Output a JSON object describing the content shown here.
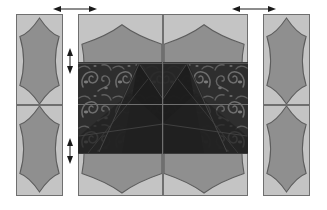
{
  "diagram": {
    "background_color": "#ffffff"
  },
  "colors": {
    "panel_fill": "#c4c4c4",
    "panel_border": "#6f6f6f",
    "hexagon_fill": "#8f8f8f",
    "hexagon_stroke": "#5c5c5c",
    "damask_base": "#2e2e2e",
    "damask_motif": "#6b6b6b",
    "damask_shadow": "#1e1e1e",
    "arrow_color": "#1a1a1a"
  },
  "side_panels": {
    "left": {
      "label": "left border panel",
      "motif": "vertical-hexagon",
      "segments": [
        {
          "name": "left-border-upper",
          "motif_label": "vertical hexagon"
        },
        {
          "name": "left-border-lower",
          "motif_label": "vertical hexagon"
        }
      ]
    },
    "right": {
      "label": "right border panel",
      "motif": "vertical-hexagon",
      "segments": [
        {
          "name": "right-border-upper",
          "motif_label": "vertical hexagon"
        },
        {
          "name": "right-border-lower",
          "motif_label": "vertical hexagon"
        }
      ]
    }
  },
  "center_grid": {
    "label": "centre block grid",
    "rows": 2,
    "columns": 2,
    "cells": [
      {
        "name": "center-cell-top-left",
        "motif_label": "horizontal hexagon"
      },
      {
        "name": "center-cell-top-right",
        "motif_label": "horizontal hexagon"
      },
      {
        "name": "center-cell-bottom-left",
        "motif_label": "horizontal hexagon"
      },
      {
        "name": "center-cell-bottom-right",
        "motif_label": "horizontal hexagon"
      }
    ]
  },
  "overlay": {
    "name": "damask-band",
    "label": "dark damask fabric band",
    "pattern": "paisley-damask",
    "shading": "diagonal pleat folds"
  },
  "arrows": [
    {
      "name": "arrow-top-left",
      "label": "width marker",
      "orientation": "horizontal",
      "heads": "double"
    },
    {
      "name": "arrow-top-right",
      "label": "width marker",
      "orientation": "horizontal",
      "heads": "double"
    },
    {
      "name": "arrow-mid-upper",
      "label": "height marker",
      "orientation": "vertical",
      "heads": "double"
    },
    {
      "name": "arrow-mid-lower",
      "label": "height marker",
      "orientation": "vertical",
      "heads": "double"
    }
  ]
}
